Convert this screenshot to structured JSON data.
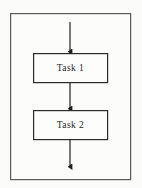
{
  "diagram": {
    "type": "flowchart",
    "canvas": {
      "width": 142,
      "height": 188,
      "background_color": "#fbfbfa"
    },
    "container": {
      "name": "outer-frame",
      "label": "",
      "x": 10,
      "y": 13,
      "width": 121,
      "height": 167,
      "stroke_color": "#5a5a5a",
      "fill_color": "#fcfcfb",
      "stroke_width": 1.2
    },
    "nodes": [
      {
        "id": "task-1",
        "label": "Task 1",
        "shape": "rectangle",
        "x": 33,
        "y": 53,
        "width": 75,
        "height": 30,
        "stroke_color": "#2b2b2b",
        "fill_color": "#fdfdfc",
        "stroke_width": 1.2
      },
      {
        "id": "task-2",
        "label": "Task 2",
        "shape": "rectangle",
        "x": 33,
        "y": 110,
        "width": 75,
        "height": 30,
        "stroke_color": "#2b2b2b",
        "fill_color": "#fdfdfc",
        "stroke_width": 1.2
      }
    ],
    "connectors": [
      {
        "id": "entry-arrow",
        "label": "",
        "from": "entry-point",
        "to": "task-1",
        "x": 70,
        "y_start": 22,
        "y_end": 53,
        "stroke_color": "#1f1f1f",
        "stroke_width": 1.2,
        "arrowhead": "filled-triangle"
      },
      {
        "id": "task1-to-task2-arrow",
        "label": "",
        "from": "task-1",
        "to": "task-2",
        "x": 70,
        "y_start": 83,
        "y_end": 110,
        "stroke_color": "#1f1f1f",
        "stroke_width": 1.2,
        "arrowhead": "filled-triangle"
      },
      {
        "id": "exit-arrow",
        "label": "",
        "from": "task-2",
        "to": "exit-point",
        "x": 70,
        "y_start": 140,
        "y_end": 168,
        "stroke_color": "#1f1f1f",
        "stroke_width": 1.2,
        "arrowhead": "filled-triangle"
      }
    ]
  }
}
